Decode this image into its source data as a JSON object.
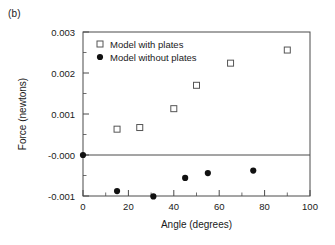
{
  "figure": {
    "panel_label": "(b)",
    "background": "#ffffff",
    "axis_color": "#4a4a4a"
  },
  "chart_data": {
    "type": "scatter",
    "title": "",
    "xlabel": "Angle (degrees)",
    "ylabel": "Force (newtons)",
    "xlim": [
      0,
      100
    ],
    "ylim": [
      -0.001,
      0.003
    ],
    "grid": false,
    "legend_position": "top-left-inside",
    "xticks": [
      0,
      20,
      40,
      60,
      80,
      100
    ],
    "xticklabels": [
      "0",
      "20",
      "40",
      "60",
      "80",
      "100"
    ],
    "xminorticks": [
      10,
      30,
      50,
      70,
      90
    ],
    "yticks": [
      0.003,
      0.002,
      0.001,
      -0.0,
      -0.001
    ],
    "yticklabels": [
      "0.003",
      "0.002",
      "0.001",
      "-0.000",
      "-0.001"
    ],
    "yminorticks": [
      0.0025,
      0.0015,
      0.0005,
      -0.0005
    ],
    "zero_line": 0.0,
    "series": [
      {
        "name": "Model with plates",
        "marker": "open-square",
        "color": "#555555",
        "points": [
          {
            "x": 15,
            "y": 0.00063
          },
          {
            "x": 25,
            "y": 0.00067
          },
          {
            "x": 40,
            "y": 0.00113
          },
          {
            "x": 50,
            "y": 0.0017
          },
          {
            "x": 65,
            "y": 0.00224
          },
          {
            "x": 90,
            "y": 0.00256
          }
        ]
      },
      {
        "name": "Model without plates",
        "marker": "filled-circle",
        "color": "#111111",
        "points": [
          {
            "x": 0,
            "y": 0.0
          },
          {
            "x": 15,
            "y": -0.00088
          },
          {
            "x": 31,
            "y": -0.00101
          },
          {
            "x": 45,
            "y": -0.00056
          },
          {
            "x": 55,
            "y": -0.00044
          },
          {
            "x": 75,
            "y": -0.00038
          }
        ]
      }
    ]
  }
}
